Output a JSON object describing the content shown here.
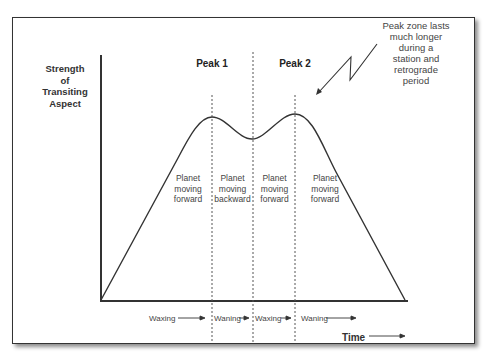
{
  "axes": {
    "y_label_lines": [
      "Strength",
      "of",
      "Transiting",
      "Aspect"
    ],
    "x_label": "Time"
  },
  "peaks": [
    {
      "label": "Peak 1"
    },
    {
      "label": "Peak 2"
    }
  ],
  "annotation": {
    "lines": [
      "Peak zone lasts",
      "much longer",
      "during a",
      "station and",
      "retrograde",
      "period"
    ]
  },
  "phases": [
    {
      "lines": [
        "Planet",
        "moving",
        "forward"
      ]
    },
    {
      "lines": [
        "Planet",
        "moving",
        "backward"
      ]
    },
    {
      "lines": [
        "Planet",
        "moving",
        "forward"
      ]
    },
    {
      "lines": [
        "Planet",
        "moving",
        "forward"
      ]
    }
  ],
  "bottom_labels": [
    {
      "label": "Waxing"
    },
    {
      "label": "Waning"
    },
    {
      "label": "Waxing"
    },
    {
      "label": "Waning"
    }
  ],
  "colors": {
    "line": "#333333",
    "dashed": "#555555",
    "text": "#444444"
  }
}
